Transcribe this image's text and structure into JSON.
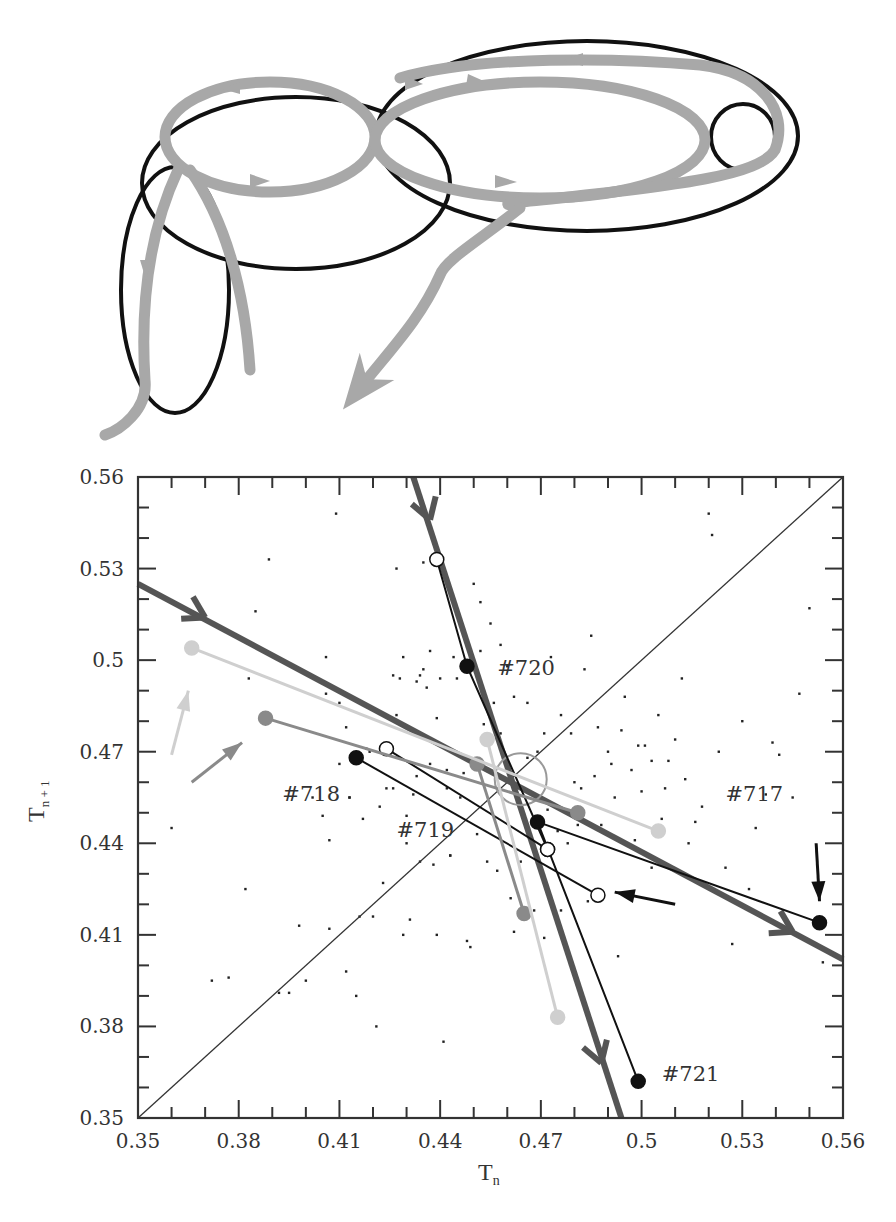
{
  "diagram": {
    "ellipse_stroke": "#111111",
    "arrow_color": "#a8a8a8"
  },
  "chart_data": {
    "type": "scatter",
    "title": "",
    "xlabel": "T",
    "xlabel_sub": "n",
    "ylabel": "T",
    "ylabel_sub": "n + 1",
    "xlim": [
      0.35,
      0.56
    ],
    "ylim": [
      0.35,
      0.56
    ],
    "xticks": [
      "0.35",
      "0.38",
      "0.41",
      "0.44",
      "0.47",
      "0.5",
      "0.53",
      "0.56"
    ],
    "yticks": [
      "0.35",
      "0.38",
      "0.41",
      "0.44",
      "0.47",
      "0.5",
      "0.53",
      "0.56"
    ],
    "tick_values": [
      0.35,
      0.38,
      0.41,
      0.44,
      0.47,
      0.5,
      0.53,
      0.56
    ],
    "minor_tick_step": 0.01,
    "grid": false,
    "diagonal": {
      "from": [
        0.35,
        0.35
      ],
      "to": [
        0.56,
        0.56
      ]
    },
    "annotations": [
      {
        "text": "#720",
        "x": 0.457,
        "y": 0.495
      },
      {
        "text": "#718",
        "x": 0.393,
        "y": 0.454
      },
      {
        "text": "#719",
        "x": 0.427,
        "y": 0.442
      },
      {
        "text": "#717",
        "x": 0.525,
        "y": 0.454
      },
      {
        "text": "#721",
        "x": 0.506,
        "y": 0.362
      }
    ],
    "stable_manifold_lines": [
      {
        "name": "thick-line-shallow",
        "color": "#555555",
        "from": [
          0.35,
          0.525
        ],
        "to": [
          0.56,
          0.402
        ],
        "arrows": [
          [
            0.37,
            0.514
          ],
          [
            0.545,
            0.411
          ]
        ]
      },
      {
        "name": "thick-line-steep",
        "color": "#555555",
        "from": [
          0.432,
          0.56
        ],
        "to": [
          0.494,
          0.35
        ],
        "arrows": [
          [
            0.437,
            0.546
          ],
          [
            0.488,
            0.368
          ]
        ]
      }
    ],
    "series": [
      {
        "name": "#717",
        "color": "#111111",
        "marker": "filled",
        "points": [
          [
            0.553,
            0.414
          ],
          [
            0.469,
            0.447
          ],
          [
            0.499,
            0.362
          ]
        ]
      },
      {
        "name": "#720",
        "color": "#111111",
        "marker": "mixed",
        "points": [
          [
            0.439,
            0.533
          ],
          [
            0.448,
            0.498
          ],
          [
            0.472,
            0.438
          ]
        ]
      },
      {
        "name": "#718",
        "color": "#111111",
        "marker": "mixed",
        "points": [
          [
            0.415,
            0.468
          ],
          [
            0.487,
            0.423
          ]
        ]
      },
      {
        "name": "#718b",
        "color": "#111111",
        "marker": "open",
        "points": [
          [
            0.424,
            0.471
          ],
          [
            0.472,
            0.438
          ]
        ]
      },
      {
        "name": "gray-traj",
        "color": "#8a8a8a",
        "marker": "filled",
        "points": [
          [
            0.388,
            0.481
          ],
          [
            0.481,
            0.45
          ]
        ]
      },
      {
        "name": "gray-traj-2",
        "color": "#8a8a8a",
        "marker": "filled",
        "points": [
          [
            0.451,
            0.466
          ],
          [
            0.465,
            0.417
          ]
        ]
      },
      {
        "name": "pale-traj",
        "color": "#cfcfcf",
        "marker": "filled",
        "points": [
          [
            0.366,
            0.504
          ],
          [
            0.505,
            0.444
          ]
        ]
      },
      {
        "name": "pale-traj-2",
        "color": "#cfcfcf",
        "marker": "filled",
        "points": [
          [
            0.454,
            0.474
          ],
          [
            0.475,
            0.383
          ]
        ]
      }
    ],
    "direction_arrows": [
      {
        "color": "#111111",
        "from": [
          0.552,
          0.44
        ],
        "to": [
          0.553,
          0.421
        ]
      },
      {
        "color": "#111111",
        "from": [
          0.51,
          0.42
        ],
        "to": [
          0.492,
          0.424
        ]
      },
      {
        "color": "#8a8a8a",
        "from": [
          0.366,
          0.46
        ],
        "to": [
          0.381,
          0.473
        ]
      },
      {
        "color": "#cfcfcf",
        "from": [
          0.36,
          0.469
        ],
        "to": [
          0.365,
          0.49
        ]
      }
    ],
    "saddle_circle": {
      "x": 0.464,
      "y": 0.461,
      "r_px": 26
    },
    "background_points": [
      [
        0.36,
        0.445
      ],
      [
        0.372,
        0.395
      ],
      [
        0.377,
        0.396
      ],
      [
        0.382,
        0.425
      ],
      [
        0.383,
        0.494
      ],
      [
        0.385,
        0.516
      ],
      [
        0.389,
        0.533
      ],
      [
        0.392,
        0.391
      ],
      [
        0.395,
        0.391
      ],
      [
        0.398,
        0.413
      ],
      [
        0.4,
        0.395
      ],
      [
        0.402,
        0.455
      ],
      [
        0.405,
        0.449
      ],
      [
        0.406,
        0.501
      ],
      [
        0.406,
        0.489
      ],
      [
        0.407,
        0.441
      ],
      [
        0.407,
        0.412
      ],
      [
        0.409,
        0.548
      ],
      [
        0.41,
        0.466
      ],
      [
        0.41,
        0.486
      ],
      [
        0.412,
        0.478
      ],
      [
        0.412,
        0.398
      ],
      [
        0.413,
        0.455
      ],
      [
        0.413,
        0.455
      ],
      [
        0.415,
        0.39
      ],
      [
        0.416,
        0.416
      ],
      [
        0.417,
        0.448
      ],
      [
        0.419,
        0.47
      ],
      [
        0.42,
        0.416
      ],
      [
        0.421,
        0.38
      ],
      [
        0.422,
        0.452
      ],
      [
        0.423,
        0.427
      ],
      [
        0.424,
        0.458
      ],
      [
        0.426,
        0.458
      ],
      [
        0.426,
        0.495
      ],
      [
        0.427,
        0.482
      ],
      [
        0.427,
        0.53
      ],
      [
        0.428,
        0.494
      ],
      [
        0.429,
        0.501
      ],
      [
        0.429,
        0.41
      ],
      [
        0.43,
        0.449
      ],
      [
        0.43,
        0.44
      ],
      [
        0.431,
        0.415
      ],
      [
        0.432,
        0.456
      ],
      [
        0.433,
        0.493
      ],
      [
        0.434,
        0.434
      ],
      [
        0.434,
        0.495
      ],
      [
        0.435,
        0.497
      ],
      [
        0.435,
        0.532
      ],
      [
        0.436,
        0.491
      ],
      [
        0.437,
        0.503
      ],
      [
        0.438,
        0.433
      ],
      [
        0.439,
        0.481
      ],
      [
        0.439,
        0.41
      ],
      [
        0.44,
        0.494
      ],
      [
        0.441,
        0.375
      ],
      [
        0.442,
        0.464
      ],
      [
        0.443,
        0.436
      ],
      [
        0.443,
        0.436
      ],
      [
        0.444,
        0.501
      ],
      [
        0.445,
        0.494
      ],
      [
        0.446,
        0.455
      ],
      [
        0.447,
        0.51
      ],
      [
        0.448,
        0.408
      ],
      [
        0.449,
        0.406
      ],
      [
        0.45,
        0.525
      ],
      [
        0.451,
        0.443
      ],
      [
        0.452,
        0.519
      ],
      [
        0.452,
        0.503
      ],
      [
        0.454,
        0.434
      ],
      [
        0.455,
        0.512
      ],
      [
        0.456,
        0.486
      ],
      [
        0.457,
        0.431
      ],
      [
        0.458,
        0.505
      ],
      [
        0.459,
        0.468
      ],
      [
        0.46,
        0.498
      ],
      [
        0.461,
        0.422
      ],
      [
        0.462,
        0.411
      ],
      [
        0.464,
        0.434
      ],
      [
        0.466,
        0.486
      ],
      [
        0.468,
        0.418
      ],
      [
        0.469,
        0.47
      ],
      [
        0.471,
        0.409
      ],
      [
        0.472,
        0.451
      ],
      [
        0.473,
        0.501
      ],
      [
        0.475,
        0.444
      ],
      [
        0.476,
        0.418
      ],
      [
        0.478,
        0.44
      ],
      [
        0.48,
        0.46
      ],
      [
        0.481,
        0.446
      ],
      [
        0.483,
        0.497
      ],
      [
        0.484,
        0.421
      ],
      [
        0.485,
        0.508
      ],
      [
        0.487,
        0.478
      ],
      [
        0.488,
        0.446
      ],
      [
        0.49,
        0.47
      ],
      [
        0.492,
        0.455
      ],
      [
        0.493,
        0.403
      ],
      [
        0.495,
        0.488
      ],
      [
        0.497,
        0.464
      ],
      [
        0.498,
        0.441
      ],
      [
        0.5,
        0.457
      ],
      [
        0.501,
        0.472
      ],
      [
        0.503,
        0.432
      ],
      [
        0.505,
        0.482
      ],
      [
        0.506,
        0.448
      ],
      [
        0.508,
        0.467
      ],
      [
        0.51,
        0.474
      ],
      [
        0.512,
        0.494
      ],
      [
        0.513,
        0.461
      ],
      [
        0.514,
        0.44
      ],
      [
        0.516,
        0.447
      ],
      [
        0.518,
        0.452
      ],
      [
        0.52,
        0.548
      ],
      [
        0.521,
        0.541
      ],
      [
        0.523,
        0.47
      ],
      [
        0.525,
        0.432
      ],
      [
        0.527,
        0.407
      ],
      [
        0.53,
        0.48
      ],
      [
        0.532,
        0.425
      ],
      [
        0.534,
        0.445
      ],
      [
        0.537,
        0.456
      ],
      [
        0.539,
        0.473
      ],
      [
        0.541,
        0.469
      ],
      [
        0.543,
        0.414
      ],
      [
        0.545,
        0.455
      ],
      [
        0.547,
        0.489
      ],
      [
        0.55,
        0.517
      ],
      [
        0.552,
        0.413
      ],
      [
        0.554,
        0.401
      ],
      [
        0.418,
        0.471
      ],
      [
        0.427,
        0.468
      ],
      [
        0.433,
        0.462
      ],
      [
        0.437,
        0.466
      ],
      [
        0.442,
        0.458
      ],
      [
        0.447,
        0.463
      ],
      [
        0.453,
        0.479
      ],
      [
        0.458,
        0.476
      ],
      [
        0.462,
        0.488
      ],
      [
        0.466,
        0.468
      ],
      [
        0.471,
        0.476
      ],
      [
        0.476,
        0.482
      ],
      [
        0.479,
        0.476
      ],
      [
        0.482,
        0.458
      ],
      [
        0.486,
        0.462
      ],
      [
        0.491,
        0.466
      ],
      [
        0.494,
        0.477
      ],
      [
        0.499,
        0.472
      ],
      [
        0.503,
        0.467
      ],
      [
        0.507,
        0.458
      ]
    ]
  }
}
